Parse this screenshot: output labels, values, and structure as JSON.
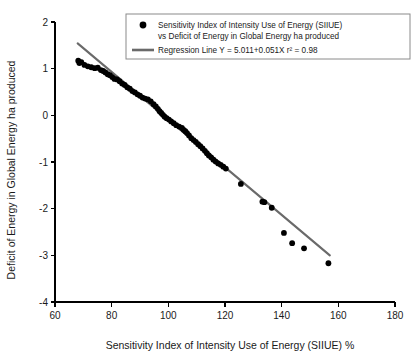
{
  "chart_data": {
    "type": "scatter",
    "title": "",
    "xlabel": "Sensitivity Index of Intensity Use of Energy  (SIIUE) %",
    "ylabel": "Deficit of Energy in Global Energy ha produced",
    "xlim": [
      60,
      180
    ],
    "ylim": [
      -4,
      2
    ],
    "xticks": [
      60,
      80,
      100,
      120,
      140,
      160,
      180
    ],
    "yticks": [
      2,
      1,
      0,
      -1,
      -2,
      -3,
      -4
    ],
    "xtick_labels": [
      "60",
      "80",
      "100",
      "120",
      "140",
      "160",
      "180"
    ],
    "ytick_labels": [
      "2",
      "1",
      "0",
      "-1",
      "-2",
      "-3",
      "-4"
    ],
    "grid": false,
    "legend_position": "top-right",
    "series": [
      {
        "name": "Sensitivity Index of Intensity Use of Energy (SIIUE) vs Deficit of Energy in Global Energy ha produced",
        "type": "scatter",
        "marker": "circle",
        "color": "#000000",
        "points": [
          [
            68.2,
            1.17
          ],
          [
            68.6,
            1.12
          ],
          [
            69.3,
            1.14
          ],
          [
            70.4,
            1.08
          ],
          [
            71.6,
            1.05
          ],
          [
            72.8,
            1.03
          ],
          [
            74.0,
            1.01
          ],
          [
            75.1,
            1.02
          ],
          [
            76.2,
            0.97
          ],
          [
            77.0,
            0.95
          ],
          [
            77.8,
            0.92
          ],
          [
            78.6,
            0.88
          ],
          [
            79.4,
            0.86
          ],
          [
            80.2,
            0.82
          ],
          [
            81.0,
            0.78
          ],
          [
            81.9,
            0.77
          ],
          [
            82.8,
            0.73
          ],
          [
            83.7,
            0.68
          ],
          [
            84.6,
            0.65
          ],
          [
            85.5,
            0.6
          ],
          [
            86.4,
            0.57
          ],
          [
            87.3,
            0.52
          ],
          [
            88.2,
            0.49
          ],
          [
            89.1,
            0.45
          ],
          [
            90.0,
            0.42
          ],
          [
            90.9,
            0.38
          ],
          [
            91.8,
            0.36
          ],
          [
            92.8,
            0.34
          ],
          [
            93.8,
            0.3
          ],
          [
            94.8,
            0.24
          ],
          [
            95.6,
            0.19
          ],
          [
            96.3,
            0.14
          ],
          [
            96.9,
            0.09
          ],
          [
            97.5,
            0.05
          ],
          [
            98.1,
            0.01
          ],
          [
            98.7,
            -0.03
          ],
          [
            99.4,
            -0.06
          ],
          [
            100.2,
            -0.09
          ],
          [
            101.0,
            -0.13
          ],
          [
            101.9,
            -0.17
          ],
          [
            102.8,
            -0.21
          ],
          [
            103.8,
            -0.24
          ],
          [
            104.8,
            -0.27
          ],
          [
            105.4,
            -0.31
          ],
          [
            106.0,
            -0.34
          ],
          [
            106.6,
            -0.38
          ],
          [
            107.3,
            -0.43
          ],
          [
            108.1,
            -0.49
          ],
          [
            108.9,
            -0.53
          ],
          [
            109.7,
            -0.57
          ],
          [
            110.5,
            -0.62
          ],
          [
            111.3,
            -0.66
          ],
          [
            112.1,
            -0.71
          ],
          [
            112.9,
            -0.76
          ],
          [
            113.6,
            -0.81
          ],
          [
            114.3,
            -0.86
          ],
          [
            115.1,
            -0.9
          ],
          [
            115.9,
            -0.95
          ],
          [
            116.7,
            -0.99
          ],
          [
            117.6,
            -1.03
          ],
          [
            118.5,
            -1.06
          ],
          [
            119.4,
            -1.1
          ],
          [
            120.3,
            -1.14
          ],
          [
            125.6,
            -1.47
          ],
          [
            133.2,
            -1.85
          ],
          [
            133.9,
            -1.86
          ],
          [
            136.5,
            -1.98
          ],
          [
            140.8,
            -2.52
          ],
          [
            143.7,
            -2.74
          ],
          [
            147.9,
            -2.85
          ],
          [
            156.5,
            -3.17
          ]
        ]
      },
      {
        "name": "Regression Line Y = 5.011+0.051X r² = 0.98",
        "type": "line",
        "color": "#6a6a6a",
        "equation": "Y = 5.011+0.051X",
        "r_squared": 0.98,
        "intercept": 5.011,
        "slope": -0.051,
        "x_start": 68,
        "x_end": 157,
        "y_start": 1.543,
        "y_end": -3.002
      }
    ],
    "legend": [
      {
        "marker": "dot",
        "lines": [
          "Sensitivity Index of Intensity Use of Energy (SIIUE)",
          "vs Deficit of Energy in Global Energy ha produced"
        ]
      },
      {
        "marker": "line",
        "lines": [
          "Regression Line Y = 5.011+0.051X r² = 0.98"
        ]
      }
    ]
  }
}
